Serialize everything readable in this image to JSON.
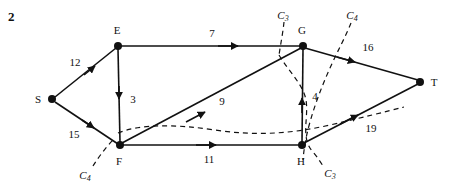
{
  "figure": {
    "number": "2",
    "width": 458,
    "height": 190,
    "background_color": "#ffffff",
    "ink_color": "#111111"
  },
  "graph": {
    "type": "directed-network-flow",
    "nodes": [
      {
        "id": "S",
        "label": "S",
        "x": 52,
        "y": 99,
        "label_x": 38,
        "label_y": 99
      },
      {
        "id": "E",
        "label": "E",
        "x": 118,
        "y": 46,
        "label_x": 117,
        "label_y": 30
      },
      {
        "id": "F",
        "label": "F",
        "x": 120,
        "y": 145,
        "label_x": 119,
        "label_y": 161
      },
      {
        "id": "G",
        "label": "G",
        "x": 303,
        "y": 46,
        "label_x": 302,
        "label_y": 30
      },
      {
        "id": "H",
        "label": "H",
        "x": 302,
        "y": 145,
        "label_x": 301,
        "label_y": 161
      },
      {
        "id": "T",
        "label": "T",
        "x": 420,
        "y": 82,
        "label_x": 434,
        "label_y": 82
      }
    ],
    "edges": [
      {
        "from": "S",
        "to": "E",
        "capacity": "12",
        "label_x": 75,
        "label_y": 62
      },
      {
        "from": "S",
        "to": "F",
        "capacity": "15",
        "label_x": 74,
        "label_y": 134
      },
      {
        "from": "E",
        "to": "F",
        "capacity": "3",
        "label_x": 133,
        "label_y": 99
      },
      {
        "from": "E",
        "to": "G",
        "capacity": "7",
        "label_x": 212,
        "label_y": 33
      },
      {
        "from": "F",
        "to": "G",
        "capacity": "9",
        "label_x": 222,
        "label_y": 101
      },
      {
        "from": "F",
        "to": "H",
        "capacity": "11",
        "label_x": 209,
        "label_y": 159
      },
      {
        "from": "H",
        "to": "G",
        "capacity": "4",
        "label_x": 315,
        "label_y": 96
      },
      {
        "from": "G",
        "to": "T",
        "capacity": "16",
        "label_x": 368,
        "label_y": 47
      },
      {
        "from": "H",
        "to": "T",
        "capacity": "19",
        "label_x": 371,
        "label_y": 128
      }
    ],
    "cuts": [
      {
        "id": "C3-top",
        "label": "C",
        "subscript": "3",
        "label_x": 283,
        "label_y": 15
      },
      {
        "id": "C4-top",
        "label": "C",
        "subscript": "4",
        "label_x": 352,
        "label_y": 15
      },
      {
        "id": "C4-bottom",
        "label": "C",
        "subscript": "4",
        "label_x": 85,
        "label_y": 175
      },
      {
        "id": "C3-bottom",
        "label": "C",
        "subscript": "3",
        "label_x": 330,
        "label_y": 173
      }
    ]
  }
}
